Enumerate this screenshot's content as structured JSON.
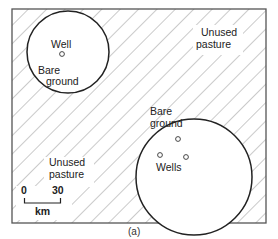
{
  "figure": {
    "caption": "(a)",
    "colors": {
      "frame": "#555555",
      "hatch": "#8a8a8a",
      "circle_stroke": "#222222",
      "background": "#ffffff"
    },
    "regions": {
      "unused_pasture_top": {
        "line1": "Unused",
        "line2": "pasture"
      },
      "unused_pasture_bottom": {
        "line1": "Unused",
        "line2": "pasture"
      },
      "small_area": {
        "well_label": "Well",
        "ground_line1": "Bare",
        "ground_line2": "ground"
      },
      "large_area": {
        "wells_label": "Wells",
        "ground_line1": "Bare",
        "ground_line2": "ground"
      }
    },
    "scale_bar": {
      "start": "0",
      "end": "30",
      "unit": "km"
    }
  }
}
